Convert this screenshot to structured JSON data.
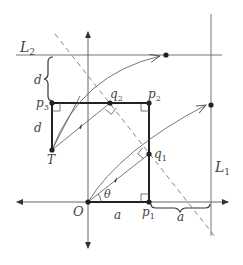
{
  "diagram": {
    "type": "geometry",
    "colors": {
      "line": "#555555",
      "thick": "#222222",
      "dashed": "#777777",
      "text": "#444444"
    },
    "labels": {
      "L1": "L",
      "L1_sub": "1",
      "L2": "L",
      "L2_sub": "2",
      "O": "O",
      "T": "T",
      "theta": "θ",
      "p1": "p",
      "p1_sub": "1",
      "p2": "p",
      "p2_sub": "2",
      "p3": "p",
      "p3_sub": "3",
      "q1": "q",
      "q1_sub": "1",
      "q2": "q",
      "q2_sub": "2",
      "a_bottom": "a",
      "a_brace": "a",
      "d_top": "d",
      "d_side": "d"
    },
    "points": {
      "O": [
        88,
        202
      ],
      "p1": [
        149,
        202
      ],
      "q1": [
        149,
        154
      ],
      "p2": [
        149,
        103
      ],
      "q2": [
        110,
        103
      ],
      "p3": [
        52,
        103
      ],
      "T": [
        52,
        150
      ],
      "L2_point": [
        166,
        55
      ],
      "L1_point": [
        211,
        105
      ]
    }
  }
}
